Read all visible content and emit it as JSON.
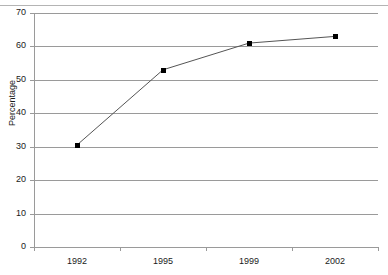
{
  "chart_data": {
    "type": "line",
    "title": "",
    "xlabel": "",
    "ylabel": "Percentage",
    "categories": [
      "1992",
      "1995",
      "1999",
      "2002"
    ],
    "values": [
      30.5,
      53,
      61,
      63
    ],
    "series": [
      {
        "name": "Percentage",
        "values": [
          30.5,
          53,
          61,
          63
        ]
      }
    ],
    "ylim": [
      0,
      70
    ],
    "yticks": [
      0,
      10,
      20,
      30,
      40,
      50,
      60,
      70
    ],
    "ytick_labels": [
      "0",
      "10",
      "20",
      "30",
      "40",
      "50",
      "60",
      "70"
    ],
    "grid": "horizontal",
    "legend": "none",
    "marker": "filled-diamond",
    "line_color": "#555555",
    "marker_color": "#000000",
    "grid_color": "#9a9a9a",
    "background_color": "#ffffff"
  },
  "axes": {
    "y_title": "Percentage"
  }
}
